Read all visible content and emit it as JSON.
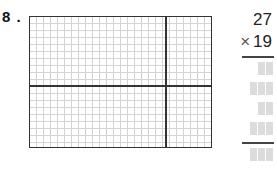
{
  "problem": {
    "number_label": "8 .",
    "multiplicand": "27",
    "operator": "×",
    "multiplier": "19",
    "grid": {
      "cell_size_px": 7,
      "line_color": "#d4d4d4",
      "border_color": "#333333",
      "sections": "2x2 area model"
    },
    "answer_placeholders": [
      {
        "row": 1,
        "digits": 2
      },
      {
        "row": 2,
        "digits": 3
      },
      {
        "row": 3,
        "digits": 2
      },
      {
        "row": 4,
        "digits": 3
      },
      {
        "row": 5,
        "digits": 3,
        "is_total": true
      }
    ]
  }
}
